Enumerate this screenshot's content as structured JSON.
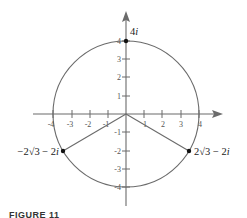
{
  "diagram": {
    "type": "complex-plane-circle",
    "axes": {
      "x_ticks": [
        "-4",
        "-3",
        "-2",
        "-1",
        "1",
        "2",
        "3",
        "4"
      ],
      "y_ticks": [
        "4",
        "3",
        "2",
        "1",
        "-1",
        "-2",
        "-3",
        "-4"
      ],
      "range": [
        -4,
        4
      ]
    },
    "circle": {
      "center": [
        0,
        0
      ],
      "radius": 4
    },
    "points": [
      {
        "label_main": "4",
        "label_i": "i",
        "x": 0,
        "y": 4
      },
      {
        "label_main": "2√3 − 2",
        "label_i": "i",
        "x": 3.464,
        "y": -2
      },
      {
        "label_main": "−2√3 − 2",
        "label_i": "i",
        "x": -3.464,
        "y": -2
      }
    ],
    "segments": [
      {
        "from": "origin",
        "to": "2√3 − 2i"
      },
      {
        "from": "origin",
        "to": "−2√3 − 2i"
      }
    ],
    "colors": {
      "line": "#6b6b6b",
      "point": "#111111"
    }
  },
  "caption": {
    "text": "FIGURE 11"
  }
}
